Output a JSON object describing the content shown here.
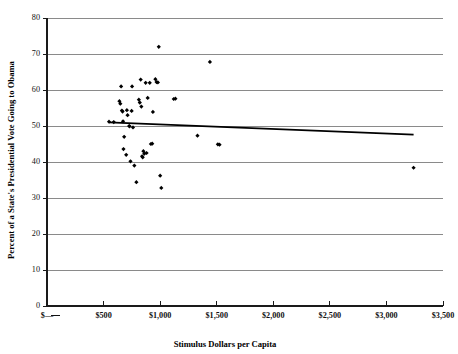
{
  "chart_data": {
    "type": "scatter",
    "title": "",
    "xlabel": "Stimulus Dollars per Capita",
    "ylabel": "Percent of a State's Presidential Vote Going to Obama",
    "xlim": [
      0,
      3500
    ],
    "ylim": [
      0,
      80
    ],
    "grid": true,
    "legend": "none",
    "x_tick_labels": [
      "$—",
      "$500",
      "$1,000",
      "$1,500",
      "$2,000",
      "$2,500",
      "$3,000",
      "$3,500"
    ],
    "x_tick_values": [
      0,
      500,
      1000,
      1500,
      2000,
      2500,
      3000,
      3500
    ],
    "y_tick_labels": [
      "0",
      "10",
      "20",
      "30",
      "40",
      "50",
      "60",
      "70",
      "80"
    ],
    "y_tick_values": [
      0,
      10,
      20,
      30,
      40,
      50,
      60,
      70,
      80
    ],
    "series": [
      {
        "name": "States",
        "marker": "diamond",
        "color": "#000000",
        "points": [
          [
            548,
            51.2
          ],
          [
            590,
            51.1
          ],
          [
            640,
            56.9
          ],
          [
            648,
            56.2
          ],
          [
            655,
            61.0
          ],
          [
            662,
            54.3
          ],
          [
            668,
            54.0
          ],
          [
            672,
            51.3
          ],
          [
            676,
            43.6
          ],
          [
            682,
            47.0
          ],
          [
            700,
            42.0
          ],
          [
            706,
            54.4
          ],
          [
            712,
            53.0
          ],
          [
            726,
            50.0
          ],
          [
            730,
            49.9
          ],
          [
            738,
            40.2
          ],
          [
            748,
            54.2
          ],
          [
            752,
            61.0
          ],
          [
            760,
            49.6
          ],
          [
            772,
            39.0
          ],
          [
            790,
            34.4
          ],
          [
            812,
            57.3
          ],
          [
            820,
            56.5
          ],
          [
            828,
            62.9
          ],
          [
            834,
            55.4
          ],
          [
            840,
            41.6
          ],
          [
            846,
            41.3
          ],
          [
            852,
            43.0
          ],
          [
            860,
            42.3
          ],
          [
            872,
            62.0
          ],
          [
            880,
            42.5
          ],
          [
            890,
            57.8
          ],
          [
            908,
            62.0
          ],
          [
            918,
            45.0
          ],
          [
            930,
            45.1
          ],
          [
            936,
            53.9
          ],
          [
            958,
            63.0
          ],
          [
            968,
            62.2
          ],
          [
            980,
            62.1
          ],
          [
            988,
            72.0
          ],
          [
            1000,
            36.2
          ],
          [
            1010,
            32.8
          ],
          [
            1120,
            57.5
          ],
          [
            1135,
            57.6
          ],
          [
            1330,
            47.3
          ],
          [
            1440,
            67.8
          ],
          [
            1510,
            44.9
          ],
          [
            1525,
            44.8
          ],
          [
            3240,
            38.4
          ]
        ]
      }
    ],
    "trendline": {
      "name": "Linear fit",
      "color": "#000000",
      "x_start": 548,
      "y_start": 51.0,
      "x_end": 3240,
      "y_end": 47.6
    }
  },
  "axes": {
    "x_title": "Stimulus Dollars per Capita",
    "y_title": "Percent of a State's Presidential Vote Going to Obama"
  }
}
